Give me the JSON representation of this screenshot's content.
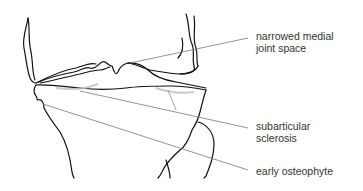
{
  "diagram": {
    "labels": [
      {
        "line1": "narrowed medial",
        "line2": "joint space"
      },
      {
        "line1": "subarticular",
        "line2": "sclerosis"
      },
      {
        "line1": "early osteophyte",
        "line2": ""
      }
    ],
    "colors": {
      "outline": "#111111",
      "leader": "#777777",
      "text": "#333333",
      "shading": "#bdbdbd"
    }
  }
}
